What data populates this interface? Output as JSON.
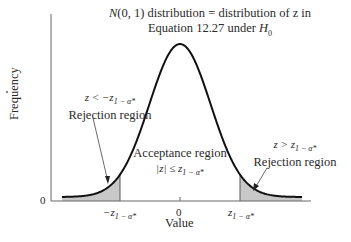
{
  "chart_data": {
    "type": "area",
    "title": "N(0, 1) distribution = distribution of z in Equation 12.27 under H0",
    "title_line1_prefix": "N",
    "title_line1_rest": "(0, 1) distribution = distribution of z in",
    "title_line2_prefix": "Equation 12.27 under ",
    "title_line2_var": "H",
    "title_line2_sub": "0",
    "xlabel": "Value",
    "ylabel": "Frequency",
    "y_zero_label": "0",
    "x_ticks": [
      {
        "label_main": "−z",
        "label_sub": "1 − α*",
        "value": -1.96
      },
      {
        "label_main": "0",
        "label_sub": "",
        "value": 0
      },
      {
        "label_main": "z",
        "label_sub": "1 − α*",
        "value": 1.96
      }
    ],
    "curve": "standard normal density N(0,1)",
    "xlim": [
      -3.6,
      3.6
    ],
    "grid": false,
    "regions": [
      {
        "name": "left-rejection",
        "condition_main": "z < −z",
        "condition_sub": "1 − α*",
        "label": "Rejection region",
        "shaded": true,
        "shade_color": "#c8c8c8"
      },
      {
        "name": "acceptance",
        "condition_main": "|z| ≤ z",
        "condition_sub": "1 − α*",
        "label": "Acceptance region",
        "shaded": false
      },
      {
        "name": "right-rejection",
        "condition_main": "z > z",
        "condition_sub": "1 − α*",
        "label": "Rejection region",
        "shaded": true,
        "shade_color": "#c8c8c8"
      }
    ],
    "colors": {
      "curve": "#111111",
      "axis": "#555555",
      "shade": "#c8c8c8",
      "text": "#2a2a2a"
    }
  }
}
